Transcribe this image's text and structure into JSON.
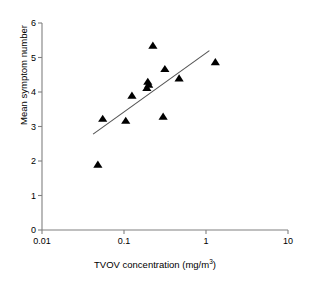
{
  "chart_data": {
    "type": "scatter",
    "title": "",
    "xlabel": "TVOV concentration (mg/m3)",
    "xlabel_base": "TVOV concentration (mg/m",
    "xlabel_sup": "3",
    "xlabel_tail": ")",
    "ylabel": "Mean symptom number",
    "x_scale": "log",
    "y_scale": "linear",
    "xlim": [
      0.01,
      10
    ],
    "ylim": [
      0,
      6
    ],
    "xticks": [
      0.01,
      0.1,
      1,
      10
    ],
    "xtick_labels": [
      "0.01",
      "0.1",
      "1",
      "10"
    ],
    "yticks": [
      0,
      1,
      2,
      3,
      4,
      5,
      6
    ],
    "ytick_labels": [
      "0",
      "1",
      "2",
      "3",
      "4",
      "5",
      "6"
    ],
    "grid": false,
    "legend": null,
    "marker": "triangle-up",
    "marker_color": "#000000",
    "line_color": "#555555",
    "points": [
      {
        "x": 0.048,
        "y": 1.9
      },
      {
        "x": 0.055,
        "y": 3.23
      },
      {
        "x": 0.105,
        "y": 3.17
      },
      {
        "x": 0.125,
        "y": 3.9
      },
      {
        "x": 0.19,
        "y": 4.12
      },
      {
        "x": 0.195,
        "y": 4.3
      },
      {
        "x": 0.2,
        "y": 4.22
      },
      {
        "x": 0.225,
        "y": 5.35
      },
      {
        "x": 0.3,
        "y": 3.29
      },
      {
        "x": 0.315,
        "y": 4.67
      },
      {
        "x": 0.47,
        "y": 4.4
      },
      {
        "x": 1.3,
        "y": 4.87
      }
    ],
    "trendline": {
      "type": "linear-on-log-x",
      "x_start": 0.042,
      "y_start": 2.78,
      "x_end": 1.1,
      "y_end": 5.2
    },
    "axis_color": "#808080",
    "text_color": "#000000"
  }
}
